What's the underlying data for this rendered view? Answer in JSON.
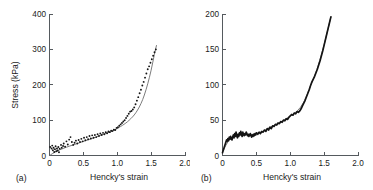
{
  "figure": {
    "background": "#ffffff",
    "line_color": "#2b2b2b",
    "smooth_color": "#6d6d6d",
    "axis_color": "#555a5e"
  },
  "panels": [
    {
      "tag": "(a)",
      "xlabel": "Hencky's strain",
      "ylabel": "Stress (kPa)",
      "xticks": [
        "0",
        "0.5",
        "1.0",
        "1.5",
        "2.0"
      ],
      "yticks": [
        "0",
        "100",
        "200",
        "300",
        "400"
      ]
    },
    {
      "tag": "(b)",
      "xlabel": "Hencky's strain",
      "ylabel": "",
      "xticks": [
        "0",
        "0.5",
        "1.0",
        "1.5",
        "2.0"
      ],
      "yticks": [
        "0",
        "50",
        "100",
        "150",
        "200"
      ]
    }
  ],
  "chart_data": [
    {
      "type": "scatter",
      "panel": "(a)",
      "title": "",
      "xlabel": "Hencky's strain",
      "ylabel": "Stress (kPa)",
      "xlim": [
        0,
        2.0
      ],
      "ylim": [
        0,
        400
      ],
      "xticks": [
        0,
        0.5,
        1.0,
        1.5,
        2.0
      ],
      "yticks": [
        0,
        100,
        200,
        300,
        400
      ],
      "grid": false,
      "legend": "none",
      "series": [
        {
          "name": "experimental data",
          "style": "markers",
          "x": [
            0.01,
            0.03,
            0.04,
            0.05,
            0.06,
            0.07,
            0.08,
            0.09,
            0.1,
            0.11,
            0.12,
            0.13,
            0.14,
            0.15,
            0.17,
            0.18,
            0.2,
            0.21,
            0.23,
            0.25,
            0.27,
            0.29,
            0.31,
            0.33,
            0.35,
            0.37,
            0.39,
            0.41,
            0.43,
            0.45,
            0.47,
            0.49,
            0.51,
            0.53,
            0.55,
            0.57,
            0.59,
            0.61,
            0.63,
            0.65,
            0.67,
            0.69,
            0.71,
            0.73,
            0.75,
            0.77,
            0.79,
            0.81,
            0.83,
            0.85,
            0.87,
            0.89,
            0.91,
            0.93,
            0.95,
            0.97,
            0.99,
            1.01,
            1.03,
            1.05,
            1.07,
            1.09,
            1.11,
            1.13,
            1.15,
            1.17,
            1.19,
            1.21,
            1.23,
            1.25,
            1.27,
            1.29,
            1.31,
            1.33,
            1.35,
            1.37,
            1.39,
            1.41,
            1.43,
            1.45,
            1.47,
            1.49,
            1.51,
            1.53,
            1.55,
            1.57
          ],
          "y": [
            24,
            20,
            28,
            15,
            22,
            10,
            18,
            26,
            12,
            20,
            14,
            24,
            9,
            19,
            30,
            22,
            27,
            34,
            25,
            40,
            31,
            45,
            52,
            38,
            30,
            36,
            42,
            34,
            44,
            38,
            47,
            40,
            50,
            43,
            52,
            46,
            55,
            48,
            57,
            50,
            58,
            52,
            60,
            55,
            62,
            58,
            64,
            60,
            66,
            63,
            68,
            66,
            70,
            69,
            73,
            72,
            78,
            80,
            84,
            88,
            92,
            96,
            100,
            106,
            112,
            118,
            124,
            126,
            130,
            136,
            145,
            155,
            165,
            176,
            186,
            198,
            208,
            220,
            232,
            244,
            252,
            262,
            272,
            282,
            292,
            300
          ]
        },
        {
          "name": "model fit",
          "style": "line",
          "x": [
            0.0,
            0.1,
            0.2,
            0.3,
            0.4,
            0.5,
            0.6,
            0.7,
            0.8,
            0.9,
            1.0,
            1.05,
            1.1,
            1.15,
            1.2,
            1.25,
            1.3,
            1.35,
            1.4,
            1.45,
            1.5,
            1.55,
            1.58
          ],
          "y": [
            0,
            12,
            20,
            27,
            33,
            40,
            46,
            53,
            60,
            67,
            76,
            82,
            88,
            95,
            104,
            114,
            128,
            146,
            170,
            202,
            240,
            288,
            312
          ]
        }
      ]
    },
    {
      "type": "line",
      "panel": "(b)",
      "title": "",
      "xlabel": "Hencky's strain",
      "ylabel": "",
      "xlim": [
        0,
        2.0
      ],
      "ylim": [
        0,
        200
      ],
      "xticks": [
        0,
        0.5,
        1.0,
        1.5,
        2.0
      ],
      "yticks": [
        0,
        50,
        100,
        150,
        200
      ],
      "grid": false,
      "legend": "none",
      "series": [
        {
          "name": "experimental data (noisy)",
          "style": "noisy-line",
          "x": [
            0.0,
            0.01,
            0.02,
            0.03,
            0.04,
            0.05,
            0.06,
            0.07,
            0.08,
            0.09,
            0.1,
            0.11,
            0.12,
            0.13,
            0.14,
            0.15,
            0.16,
            0.17,
            0.18,
            0.19,
            0.2,
            0.21,
            0.22,
            0.23,
            0.24,
            0.25,
            0.26,
            0.27,
            0.28,
            0.29,
            0.3,
            0.31,
            0.32,
            0.33,
            0.34,
            0.35,
            0.36,
            0.37,
            0.38,
            0.39,
            0.4,
            0.41,
            0.42,
            0.43,
            0.44,
            0.45,
            0.46,
            0.47,
            0.48,
            0.49,
            0.5,
            0.52,
            0.54,
            0.56,
            0.58,
            0.6,
            0.62,
            0.64,
            0.66,
            0.68,
            0.7,
            0.72,
            0.74,
            0.76,
            0.78,
            0.8,
            0.82,
            0.84,
            0.86,
            0.88,
            0.9,
            0.92,
            0.94,
            0.96,
            0.98,
            1.0,
            1.02,
            1.04,
            1.06,
            1.08,
            1.1,
            1.12,
            1.14,
            1.16,
            1.18,
            1.2,
            1.22,
            1.24,
            1.26,
            1.28,
            1.3,
            1.32,
            1.34,
            1.36,
            1.38,
            1.4,
            1.42,
            1.44,
            1.46,
            1.48,
            1.5,
            1.52,
            1.54,
            1.56,
            1.58,
            1.6
          ],
          "y": [
            4,
            7,
            10,
            13,
            16,
            19,
            22,
            20,
            24,
            21,
            26,
            23,
            27,
            24,
            22,
            26,
            29,
            25,
            31,
            27,
            33,
            28,
            25,
            30,
            27,
            32,
            29,
            34,
            30,
            27,
            33,
            30,
            28,
            31,
            29,
            33,
            31,
            28,
            30,
            27,
            29,
            31,
            28,
            26,
            29,
            27,
            30,
            28,
            31,
            29,
            32,
            30,
            33,
            31,
            34,
            33,
            36,
            34,
            38,
            36,
            40,
            38,
            42,
            41,
            44,
            43,
            46,
            45,
            48,
            47,
            50,
            49,
            52,
            51,
            54,
            56,
            58,
            57,
            60,
            59,
            62,
            61,
            63,
            66,
            70,
            74,
            78,
            83,
            88,
            93,
            99,
            104,
            108,
            112,
            117,
            122,
            128,
            134,
            141,
            148,
            156,
            164,
            172,
            180,
            188,
            196
          ]
        },
        {
          "name": "mean response",
          "style": "line",
          "x": [
            0.0,
            0.1,
            0.2,
            0.3,
            0.4,
            0.5,
            0.6,
            0.7,
            0.8,
            0.9,
            1.0,
            1.1,
            1.2,
            1.3,
            1.4,
            1.5,
            1.6
          ],
          "y": [
            5,
            24,
            30,
            31,
            29,
            31,
            34,
            40,
            44,
            49,
            56,
            62,
            74,
            99,
            122,
            156,
            196
          ]
        }
      ]
    }
  ]
}
